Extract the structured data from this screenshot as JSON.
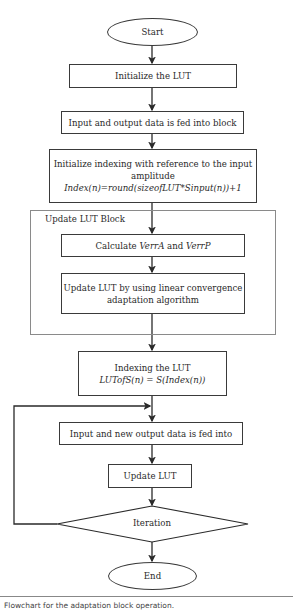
{
  "flowchart": {
    "start": "Start",
    "init_lut": "Initialize the LUT",
    "feed_data": "Input and output data is fed into block",
    "init_index": {
      "line1": "Initialize indexing with reference to the input",
      "line2": "amplitude",
      "formula": "Index(n)=round(sizeofLUT*Sinput(n))+1"
    },
    "update_block": {
      "label": "Update LUT Block",
      "calc": {
        "prefix": "Calculate ",
        "var1": "VerrA",
        "mid": " and ",
        "var2": "VerrP"
      },
      "adapt": {
        "line1": "Update LUT by using linear convergence",
        "line2": "adaptation algorithm"
      }
    },
    "indexing": {
      "line1": "Indexing the LUT",
      "formula": "LUTofS(n) = S(Index(n))"
    },
    "feed_new": "Input and new output data is fed into",
    "update_lut": "Update LUT",
    "iteration": "Iteration",
    "end": "End"
  },
  "caption": "Flowchart for the adaptation block operation."
}
